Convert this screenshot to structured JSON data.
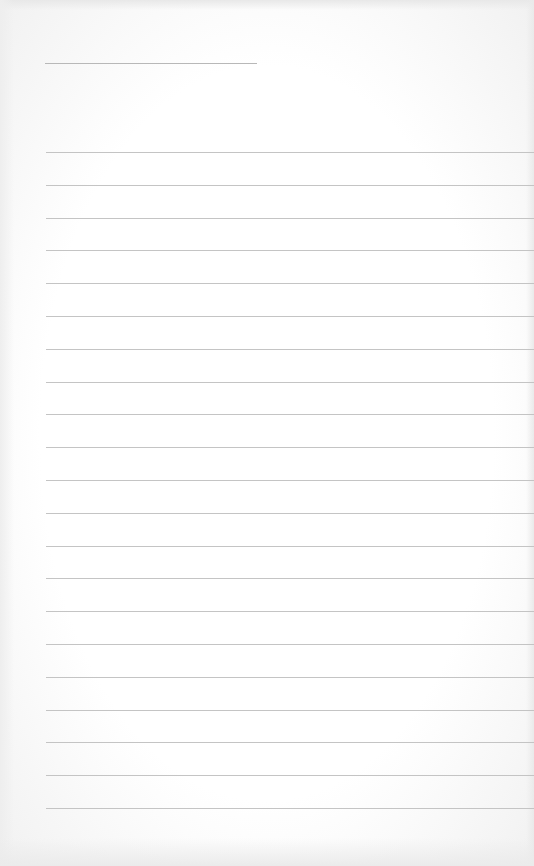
{
  "page": {
    "type": "blank lined notepad page",
    "title_line": {
      "text": ""
    },
    "rule_count": 21,
    "rule_color": "#c4c4c4",
    "background_color": "#ffffff",
    "lines": [
      "",
      "",
      "",
      "",
      "",
      "",
      "",
      "",
      "",
      "",
      "",
      "",
      "",
      "",
      "",
      "",
      "",
      "",
      "",
      "",
      ""
    ]
  }
}
